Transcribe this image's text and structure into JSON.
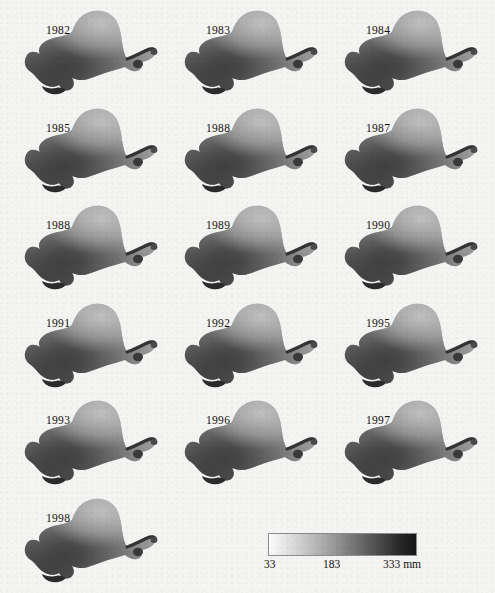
{
  "figure": {
    "kind": "small-multiples-choropleth-map-series",
    "background_color": "#f4f4f2"
  },
  "panels": [
    {
      "year": "1982",
      "col": 0,
      "row": 0
    },
    {
      "year": "1983",
      "col": 1,
      "row": 0
    },
    {
      "year": "1984",
      "col": 2,
      "row": 0
    },
    {
      "year": "1985",
      "col": 0,
      "row": 1
    },
    {
      "year": "1988",
      "col": 1,
      "row": 1
    },
    {
      "year": "1987",
      "col": 2,
      "row": 1
    },
    {
      "year": "1988",
      "col": 0,
      "row": 2
    },
    {
      "year": "1989",
      "col": 1,
      "row": 2
    },
    {
      "year": "1990",
      "col": 2,
      "row": 2
    },
    {
      "year": "1991",
      "col": 0,
      "row": 3
    },
    {
      "year": "1992",
      "col": 1,
      "row": 3
    },
    {
      "year": "1995",
      "col": 2,
      "row": 3
    },
    {
      "year": "1993",
      "col": 0,
      "row": 4
    },
    {
      "year": "1996",
      "col": 1,
      "row": 4
    },
    {
      "year": "1997",
      "col": 2,
      "row": 4
    },
    {
      "year": "1998",
      "col": 0,
      "row": 5
    }
  ],
  "legend": {
    "min_label": "33",
    "mid_label": "183",
    "max_label": "333 mm",
    "min_value": 33,
    "mid_value": 183,
    "max_value": 333,
    "unit": "mm",
    "ramp_low_color": "#fdfdfd",
    "ramp_mid_color": "#7c7c7c",
    "ramp_high_color": "#161616"
  },
  "chart_data": {
    "type": "heatmap",
    "title": "",
    "xlabel": "",
    "ylabel": "",
    "categories": [
      "1982",
      "1983",
      "1984",
      "1985",
      "1988",
      "1987",
      "1988",
      "1989",
      "1990",
      "1991",
      "1992",
      "1995",
      "1993",
      "1996",
      "1997",
      "1998"
    ],
    "colorbar": {
      "min": 33,
      "mid": 183,
      "max": 333,
      "unit": "mm",
      "scale": "grayscale-light-to-dark"
    },
    "grid": false,
    "legend_position": "bottom-right"
  }
}
